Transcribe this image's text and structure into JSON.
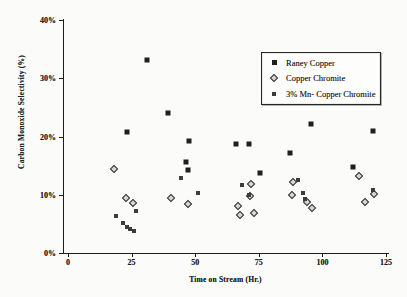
{
  "chart_data": {
    "type": "scatter",
    "title": "",
    "xlabel": "Time on Stream (Hr.)",
    "ylabel": "Carbon Monoxide Selectivity (%)",
    "xlim": [
      0,
      125
    ],
    "ylim": [
      0,
      40
    ],
    "grid": false,
    "legend_position": "inside-upper-right-box",
    "x_ticks": [
      {
        "v": 0,
        "label": "0"
      },
      {
        "v": 25,
        "label": "25"
      },
      {
        "v": 50,
        "label": "50"
      },
      {
        "v": 75,
        "label": "75"
      },
      {
        "v": 100,
        "label": "100"
      },
      {
        "v": 125,
        "label": "125"
      }
    ],
    "y_ticks": [
      {
        "v": 0,
        "label": "0%"
      },
      {
        "v": 10,
        "label": "10%"
      },
      {
        "v": 20,
        "label": "20%"
      },
      {
        "v": 30,
        "label": "30%"
      },
      {
        "v": 40,
        "label": "40%"
      }
    ],
    "series": [
      {
        "name": "Raney Copper",
        "marker": "filled-black-square",
        "points": [
          [
            23,
            20.7
          ],
          [
            31,
            33.2
          ],
          [
            39.5,
            24.0
          ],
          [
            46.4,
            15.6
          ],
          [
            47,
            14.3
          ],
          [
            47.7,
            19.2
          ],
          [
            66,
            18.7
          ],
          [
            71.3,
            18.7
          ],
          [
            75.5,
            13.7
          ],
          [
            87.3,
            17.1
          ],
          [
            95.5,
            22.2
          ],
          [
            112,
            14.7
          ],
          [
            119.8,
            20.9
          ]
        ]
      },
      {
        "name": "Copper Chromite",
        "marker": "open-diamond",
        "points": [
          [
            18,
            14.4
          ],
          [
            22.8,
            9.4
          ],
          [
            25.4,
            8.6
          ],
          [
            40.5,
            9.5
          ],
          [
            47.3,
            8.4
          ],
          [
            67,
            8.1
          ],
          [
            67.6,
            6.6
          ],
          [
            71.5,
            9.7
          ],
          [
            71.8,
            11.8
          ],
          [
            73.2,
            6.8
          ],
          [
            88.2,
            10.0
          ],
          [
            88.6,
            12.2
          ],
          [
            93.8,
            8.8
          ],
          [
            96,
            7.7
          ],
          [
            114.5,
            13.3
          ],
          [
            116.8,
            8.8
          ],
          [
            120.1,
            10.2
          ]
        ]
      },
      {
        "name": "3% Mn- Copper Chromite",
        "marker": "filled-gray-square",
        "points": [
          [
            18.9,
            6.4
          ],
          [
            21.7,
            5.1
          ],
          [
            23.1,
            4.5
          ],
          [
            24.3,
            4.1
          ],
          [
            25.8,
            3.8
          ],
          [
            26.7,
            7.2
          ],
          [
            44.4,
            12.9
          ],
          [
            51.2,
            10.3
          ],
          [
            68.3,
            11.7
          ],
          [
            71.2,
            9.9
          ],
          [
            90.5,
            12.6
          ],
          [
            92.5,
            10.3
          ],
          [
            93.2,
            9.3
          ],
          [
            119.9,
            10.9
          ]
        ]
      }
    ],
    "colors": {
      "marker_black": "#1f1f1f",
      "marker_gray": "#3c3c3c",
      "diamond_fill": "#d6d6d6",
      "axis": "#1c1c1c",
      "background": "#fbfbf9"
    }
  }
}
